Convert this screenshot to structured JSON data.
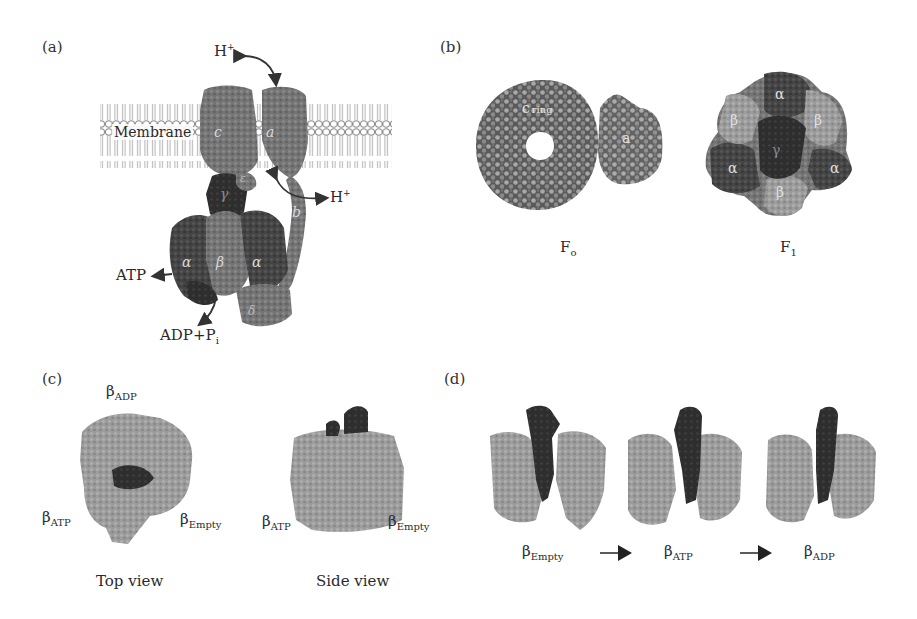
{
  "figure": {
    "panels": {
      "a": {
        "label": "(a)",
        "membrane_label": "Membrane",
        "subunit_labels": {
          "c": "c",
          "a": "a",
          "gamma": "γ",
          "epsilon": "ε",
          "b": "b",
          "alpha_left": "α",
          "beta": "β",
          "alpha_right": "α",
          "delta": "δ"
        },
        "arrows": {
          "proton_in": {
            "base": "H",
            "sup": "+"
          },
          "proton_out": {
            "base": "H",
            "sup": "+"
          },
          "atp": "ATP",
          "adp_pi": {
            "base": "ADP+P",
            "sub": "i"
          }
        }
      },
      "b": {
        "label": "(b)",
        "fo": {
          "caption_base": "F",
          "caption_sub": "o",
          "ring_label": "c",
          "ring_label_2": "ring",
          "subunit_label": "a"
        },
        "f1": {
          "caption_base": "F",
          "caption_sub": "1",
          "labels": {
            "alpha_top": "α",
            "beta_left": "β",
            "beta_right": "β",
            "gamma_center": "γ",
            "alpha_left": "α",
            "alpha_right": "α",
            "beta_bottom": "β"
          }
        }
      },
      "c": {
        "label": "(c)",
        "top_view": {
          "caption": "Top view",
          "beta_adp": {
            "base": "β",
            "sub": "ADP"
          },
          "beta_atp": {
            "base": "β",
            "sub": "ATP"
          },
          "beta_empty": {
            "base": "β",
            "sub": "Empty"
          }
        },
        "side_view": {
          "caption": "Side view",
          "beta_atp": {
            "base": "β",
            "sub": "ATP"
          },
          "beta_empty": {
            "base": "β",
            "sub": "Empty"
          }
        }
      },
      "d": {
        "label": "(d)",
        "states": [
          {
            "base": "β",
            "sub": "Empty"
          },
          {
            "base": "β",
            "sub": "ATP"
          },
          {
            "base": "β",
            "sub": "ADP"
          }
        ]
      }
    },
    "colors": {
      "light_protein": "#9a9a9a",
      "mid_protein": "#6e6e6e",
      "dark_protein": "#3a3a3a",
      "darkest": "#262626",
      "membrane_line": "#8a8a8a",
      "text": "#2a2a2a"
    }
  }
}
